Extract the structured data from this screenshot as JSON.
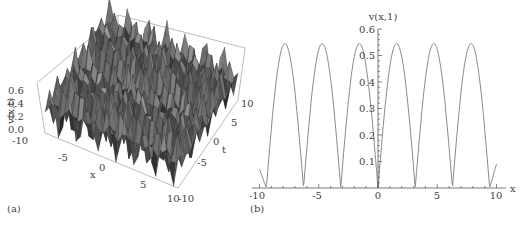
{
  "chart_data": [
    {
      "type": "surface3d",
      "panel_label": "(a)",
      "zlabel": "v(x,t)",
      "xlabel": "x",
      "ylabel": "t",
      "z_ticks": [
        "0.0",
        "0.2",
        "0.4",
        "0.6"
      ],
      "x_ticks": [
        "-10",
        "-5",
        "0",
        "5",
        "10"
      ],
      "t_ticks": [
        "-10",
        "-5",
        "0",
        "5",
        "10"
      ],
      "xlim": [
        -10,
        10
      ],
      "tlim": [
        -10,
        10
      ],
      "zlim": [
        0,
        0.65
      ],
      "description": "Dense oscillatory periodic surface of v(x,t) with many peaks up to ~0.6"
    },
    {
      "type": "line",
      "panel_label": "(b)",
      "title": "",
      "xlabel": "x",
      "ylabel": "v(x,1)",
      "xlim": [
        -10,
        10
      ],
      "ylim": [
        0,
        0.6
      ],
      "x_ticks": [
        "-10",
        "-5",
        "0",
        "5",
        "10"
      ],
      "y_ticks": [
        "0.1",
        "0.2",
        "0.3",
        "0.4",
        "0.5",
        "0.6"
      ],
      "grid": false,
      "series": [
        {
          "name": "v(x,1)",
          "color": "#888888",
          "x": [
            -10,
            -9.42,
            -7.85,
            -6.28,
            -4.71,
            -3.14,
            -1.57,
            0,
            1.57,
            3.14,
            4.71,
            6.28,
            7.85,
            9.42,
            10
          ],
          "y": [
            0.07,
            0.0,
            0.545,
            0.0,
            0.545,
            0.0,
            0.545,
            0.0,
            0.545,
            0.0,
            0.545,
            0.0,
            0.545,
            0.0,
            0.09
          ]
        }
      ]
    }
  ],
  "panels": {
    "a": {
      "label": "(a)",
      "zlabel": "v(x,t)",
      "xlabel": "x",
      "tlabel": "t",
      "z_ticks": [
        "0.0",
        "0.2",
        "0.4",
        "0.6"
      ],
      "x_ticks": [
        "-10",
        "-5",
        "0",
        "5",
        "10"
      ],
      "t_ticks": [
        "10",
        "5",
        "0",
        "-5",
        "-10"
      ]
    },
    "b": {
      "label": "(b)",
      "ylabel": "v(x,1)",
      "xlabel": "x",
      "x_ticks": [
        "-10",
        "-5",
        "0",
        "5",
        "10"
      ],
      "y_ticks": [
        "0.1",
        "0.2",
        "0.3",
        "0.4",
        "0.5",
        "0.6"
      ]
    }
  }
}
